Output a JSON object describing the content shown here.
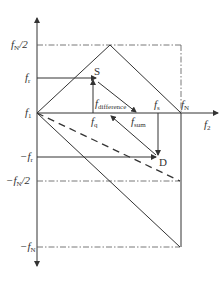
{
  "diagram": {
    "type": "frequency-folding-diagram",
    "colors": {
      "line": "#333333",
      "background": "#ffffff"
    },
    "axes": {
      "vertical": {
        "direction": "up-and-down arrows"
      },
      "horizontal": {
        "label_base": "f",
        "label_sub": "2"
      }
    },
    "left_labels": [
      {
        "id": "fN2",
        "prefix": "",
        "base": "f",
        "sub": "N",
        "suffix": "/2"
      },
      {
        "id": "fr",
        "prefix": "",
        "base": "f",
        "sub": "r",
        "suffix": ""
      },
      {
        "id": "f1",
        "prefix": "",
        "base": "f",
        "sub": "1",
        "suffix": ""
      },
      {
        "id": "neg_fr",
        "prefix": "−",
        "base": "f",
        "sub": "r",
        "suffix": ""
      },
      {
        "id": "neg_fN2",
        "prefix": "−",
        "base": "f",
        "sub": "N",
        "suffix": "/2"
      },
      {
        "id": "neg_fN",
        "prefix": "−",
        "base": "f",
        "sub": "N",
        "suffix": ""
      }
    ],
    "inner_labels": {
      "fq": {
        "base": "f",
        "sub": "q"
      },
      "fdifference": {
        "base": "f",
        "sub": "difference"
      },
      "fsum": {
        "base": "f",
        "sub": "sum"
      },
      "fs": {
        "base": "f",
        "sub": "s"
      },
      "fN": {
        "base": "f",
        "sub": "N"
      }
    },
    "points": {
      "S": "S",
      "D": "D"
    }
  }
}
